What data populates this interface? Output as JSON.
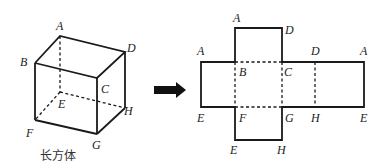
{
  "cuboid": {
    "caption": "长方体",
    "vertices": {
      "A": "A",
      "B": "B",
      "C": "C",
      "D": "D",
      "E": "E",
      "F": "F",
      "G": "G",
      "H": "H"
    }
  },
  "arrow": {
    "direction": "right",
    "color": "#111111"
  },
  "net": {
    "top_square": {
      "tl": "A",
      "tr": "D"
    },
    "middle_row_top": [
      "A",
      "B",
      "C",
      "D",
      "A"
    ],
    "middle_row_bottom": [
      "E",
      "F",
      "G",
      "H",
      "E"
    ],
    "bottom_square": {
      "bl": "E",
      "br": "H"
    }
  }
}
